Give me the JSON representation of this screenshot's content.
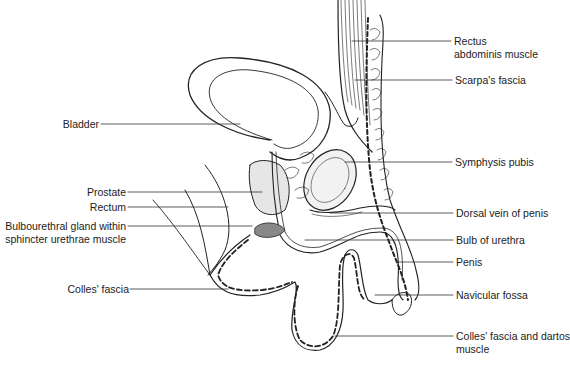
{
  "figure": {
    "type": "anatomical line drawing",
    "colors": {
      "ink": "#222222",
      "background": "#ffffff",
      "stipple": "#cfcfcf"
    }
  },
  "labels_left": [
    {
      "id": "bladder",
      "text": "Bladder"
    },
    {
      "id": "prostate",
      "text": "Prostate"
    },
    {
      "id": "rectum",
      "text": "Rectum"
    },
    {
      "id": "bulbourethral_1",
      "text": "Bulbourethral gland within"
    },
    {
      "id": "bulbourethral_2",
      "text": "sphincter urethrae muscle"
    },
    {
      "id": "colles",
      "text": "Colles' fascia"
    }
  ],
  "labels_right": [
    {
      "id": "rectus_1",
      "text": "Rectus"
    },
    {
      "id": "rectus_2",
      "text": "abdominis muscle"
    },
    {
      "id": "scarpa",
      "text": "Scarpa's fascia"
    },
    {
      "id": "symphysis",
      "text": "Symphysis pubis"
    },
    {
      "id": "dorsal_vein",
      "text": "Dorsal vein of penis"
    },
    {
      "id": "bulb",
      "text": "Bulb of urethra"
    },
    {
      "id": "penis",
      "text": "Penis"
    },
    {
      "id": "navicular",
      "text": "Navicular fossa"
    },
    {
      "id": "colles_dartos_1",
      "text": "Colles' fascia and dartos"
    },
    {
      "id": "colles_dartos_2",
      "text": "muscle"
    }
  ]
}
